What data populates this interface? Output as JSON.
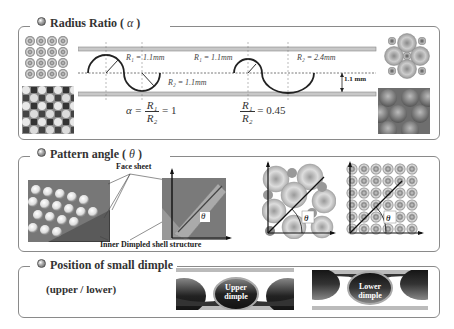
{
  "sections": {
    "radius_ratio": {
      "title": "Radius Ratio (",
      "symbol": "α",
      "close": " )",
      "labels": {
        "r1_left": "R₁ = 1.1mm",
        "r2_left": "R₂ = 1.1mm",
        "r1_right": "R₁ = 1.1mm",
        "r2_right": "R₂ = 2.4mm",
        "gap": "1.1 mm"
      },
      "equations": {
        "left_prefix": "α =",
        "left_num": "R₁",
        "left_den": "R₂",
        "left_value": "= 1",
        "right_num": "R₁",
        "right_den": "R₂",
        "right_value": "= 0.45"
      }
    },
    "pattern_angle": {
      "title": "Pattern angle (",
      "symbol": "θ",
      "close": " )",
      "labels": {
        "face_sheet": "Face sheet",
        "inner_structure": "Inner Dimpled shell structure",
        "theta": "θ"
      }
    },
    "small_dimple": {
      "title": "Position of small dimple",
      "subtitle": "(upper / lower)",
      "labels": {
        "upper": "Upper dimple",
        "lower": "Lower dimple"
      }
    }
  },
  "colors": {
    "frame": "#8a8a8a",
    "plate": "#b8b8b8",
    "dimple_dark": "#333333",
    "square_bg": "#7a7a7a"
  }
}
